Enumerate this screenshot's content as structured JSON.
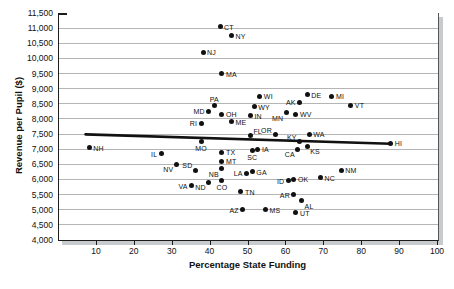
{
  "figure": {
    "background": "#ffffff",
    "axis_color": "#1c1c1c",
    "grid_color": "#b5b5b5",
    "dot_color": "#111111",
    "trend_color": "#111111",
    "shadow_color": "#c8cbce"
  },
  "chart_data": {
    "type": "scatter",
    "title": "",
    "xlabel": "Percentage State Funding",
    "ylabel": "Revenue per Pupil ($)",
    "xlim": [
      0,
      100
    ],
    "ylim": [
      4000,
      11500
    ],
    "grid": "horizontal",
    "legend": "none",
    "xticks": [
      10,
      20,
      30,
      40,
      50,
      60,
      70,
      80,
      90,
      100
    ],
    "yticks": [
      {
        "value": 4000,
        "label": "4,000"
      },
      {
        "value": 4500,
        "label": "4,500"
      },
      {
        "value": 5000,
        "label": "5,000"
      },
      {
        "value": 5500,
        "label": "5,500"
      },
      {
        "value": 6000,
        "label": "6,000"
      },
      {
        "value": 6500,
        "label": "6,500"
      },
      {
        "value": 7000,
        "label": "7,000"
      },
      {
        "value": 7500,
        "label": "7,500"
      },
      {
        "value": 8000,
        "label": "8,000"
      },
      {
        "value": 8500,
        "label": "8,500"
      },
      {
        "value": 9000,
        "label": "9,000"
      },
      {
        "value": 9500,
        "label": "9,500"
      },
      {
        "value": 10000,
        "label": "10,000"
      },
      {
        "value": 10500,
        "label": "10,500"
      },
      {
        "value": 11000,
        "label": "11,000"
      },
      {
        "value": 11500,
        "label": "11,500"
      }
    ],
    "trend_line": {
      "x1": 7,
      "y1": 7490,
      "x2": 87.5,
      "y2": 7180
    },
    "points": [
      {
        "state": "CT",
        "x": 42.5,
        "y": 11050,
        "label_pos": "r"
      },
      {
        "state": "NY",
        "x": 45.5,
        "y": 10750,
        "label_pos": "r"
      },
      {
        "state": "NJ",
        "x": 38,
        "y": 10200,
        "label_pos": "r"
      },
      {
        "state": "MA",
        "x": 43,
        "y": 9500,
        "label_pos": "r"
      },
      {
        "state": "PA",
        "x": 41,
        "y": 8450,
        "label_pos": "t"
      },
      {
        "state": "MD",
        "x": 39.5,
        "y": 8250,
        "label_pos": "l"
      },
      {
        "state": "OH",
        "x": 43,
        "y": 8150,
        "label_pos": "r"
      },
      {
        "state": "RI",
        "x": 37.5,
        "y": 7850,
        "label_pos": "l"
      },
      {
        "state": "ME",
        "x": 45.5,
        "y": 7900,
        "label_pos": "r"
      },
      {
        "state": "WI",
        "x": 53,
        "y": 8750,
        "label_pos": "r"
      },
      {
        "state": "WY",
        "x": 51.5,
        "y": 8400,
        "label_pos": "r"
      },
      {
        "state": "IN",
        "x": 50.5,
        "y": 8100,
        "label_pos": "r"
      },
      {
        "state": "MN",
        "x": 60,
        "y": 8200,
        "label_pos": "bl"
      },
      {
        "state": "WV",
        "x": 62.5,
        "y": 8150,
        "label_pos": "r"
      },
      {
        "state": "AK",
        "x": 63.5,
        "y": 8550,
        "label_pos": "l"
      },
      {
        "state": "DE",
        "x": 65.5,
        "y": 8800,
        "label_pos": "r"
      },
      {
        "state": "MI",
        "x": 72,
        "y": 8750,
        "label_pos": "r"
      },
      {
        "state": "VT",
        "x": 77,
        "y": 8450,
        "label_pos": "r"
      },
      {
        "state": "OR",
        "x": 57,
        "y": 7480,
        "label_pos": "tl"
      },
      {
        "state": "FL",
        "x": 50.5,
        "y": 7450,
        "label_pos": "tr"
      },
      {
        "state": "KY",
        "x": 63.5,
        "y": 7250,
        "label_pos": "tl"
      },
      {
        "state": "WA",
        "x": 66,
        "y": 7500,
        "label_pos": "r"
      },
      {
        "state": "CA",
        "x": 63,
        "y": 7000,
        "label_pos": "bl"
      },
      {
        "state": "KS",
        "x": 65.5,
        "y": 7100,
        "label_pos": "br"
      },
      {
        "state": "HI",
        "x": 87.5,
        "y": 7200,
        "label_pos": "r"
      },
      {
        "state": "NH",
        "x": 8,
        "y": 7050,
        "label_pos": "r"
      },
      {
        "state": "MO",
        "x": 37.5,
        "y": 7250,
        "label_pos": "b"
      },
      {
        "state": "TX",
        "x": 43,
        "y": 6900,
        "label_pos": "r"
      },
      {
        "state": "MT",
        "x": 43,
        "y": 6600,
        "label_pos": "r"
      },
      {
        "state": "SC",
        "x": 51,
        "y": 6950,
        "label_pos": "b"
      },
      {
        "state": "IA",
        "x": 52.5,
        "y": 7000,
        "label_pos": "r"
      },
      {
        "state": "IL",
        "x": 27,
        "y": 6850,
        "label_pos": "l"
      },
      {
        "state": "NV",
        "x": 31,
        "y": 6500,
        "label_pos": "bl"
      },
      {
        "state": "SD",
        "x": 36,
        "y": 6300,
        "label_pos": "tl"
      },
      {
        "state": "NB",
        "x": 43,
        "y": 6350,
        "label_pos": "bl"
      },
      {
        "state": "LA",
        "x": 49.5,
        "y": 6200,
        "label_pos": "l"
      },
      {
        "state": "GA",
        "x": 51,
        "y": 6250,
        "label_pos": "r"
      },
      {
        "state": "VA",
        "x": 35,
        "y": 5800,
        "label_pos": "l"
      },
      {
        "state": "ND",
        "x": 39.5,
        "y": 5900,
        "label_pos": "bl"
      },
      {
        "state": "CO",
        "x": 43,
        "y": 5950,
        "label_pos": "b"
      },
      {
        "state": "TN",
        "x": 48,
        "y": 5600,
        "label_pos": "r"
      },
      {
        "state": "ID",
        "x": 60.5,
        "y": 5950,
        "label_pos": "l"
      },
      {
        "state": "OK",
        "x": 62,
        "y": 6000,
        "label_pos": "r"
      },
      {
        "state": "NC",
        "x": 69,
        "y": 6050,
        "label_pos": "r"
      },
      {
        "state": "NM",
        "x": 74.5,
        "y": 6300,
        "label_pos": "r"
      },
      {
        "state": "AR",
        "x": 62,
        "y": 5500,
        "label_pos": "l"
      },
      {
        "state": "AL",
        "x": 64,
        "y": 5300,
        "label_pos": "br"
      },
      {
        "state": "AZ",
        "x": 48.5,
        "y": 5000,
        "label_pos": "l"
      },
      {
        "state": "MS",
        "x": 54.5,
        "y": 5000,
        "label_pos": "r"
      },
      {
        "state": "UT",
        "x": 62.5,
        "y": 4900,
        "label_pos": "r"
      }
    ]
  }
}
